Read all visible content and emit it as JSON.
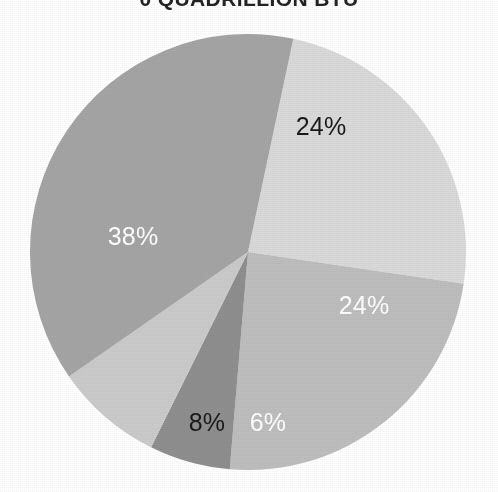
{
  "chart_data": {
    "type": "pie",
    "title": "0 QUADRILLION BTU",
    "xlabel": "",
    "ylabel": "",
    "grid": false,
    "legend": "none",
    "total_percent": 100,
    "categories": [
      "Slice 1",
      "Slice 2",
      "Slice 3",
      "Slice 4",
      "Slice 5"
    ],
    "values": [
      24,
      24,
      6,
      8,
      38
    ],
    "labels": [
      "24%",
      "24%",
      "6%",
      "8%",
      "38%"
    ],
    "slices": [
      {
        "label": "24%",
        "value": 24,
        "color": "#dadada",
        "label_color": "#1a1a1a",
        "start_angle_deg": 12,
        "end_angle_deg": 98.4,
        "label_x": 321,
        "label_y": 128
      },
      {
        "label": "24%",
        "value": 24,
        "color": "#bebebe",
        "label_color": "#ffffff",
        "start_angle_deg": 98.4,
        "end_angle_deg": 184.8,
        "label_x": 364,
        "label_y": 307
      },
      {
        "label": "6%",
        "value": 6,
        "color": "#8f8f8f",
        "label_color": "#ffffff",
        "start_angle_deg": 184.8,
        "end_angle_deg": 206.4,
        "label_x": 268,
        "label_y": 424
      },
      {
        "label": "8%",
        "value": 8,
        "color": "#cbcbcb",
        "label_color": "#1a1a1a",
        "start_angle_deg": 206.4,
        "end_angle_deg": 235.2,
        "label_x": 207,
        "label_y": 424
      },
      {
        "label": "38%",
        "value": 38,
        "color": "#a5a5a5",
        "label_color": "#ffffff",
        "start_angle_deg": 235.2,
        "end_angle_deg": 372,
        "label_x": 133,
        "label_y": 238
      }
    ],
    "geometry": {
      "center_x": 248,
      "center_y": 252,
      "radius": 218
    },
    "colors": {
      "background": "#ffffff",
      "title": "#232323",
      "label_light": "#ffffff",
      "label_dark": "#1a1a1a"
    }
  }
}
